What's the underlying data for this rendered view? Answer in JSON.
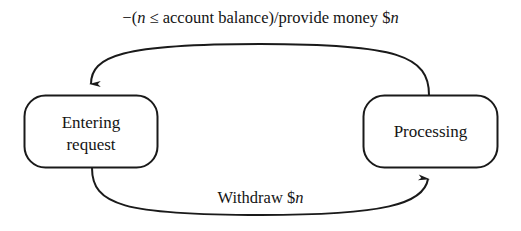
{
  "diagram": {
    "type": "state-transition-diagram",
    "background_color": "#ffffff",
    "stroke_color": "#1a1a1a",
    "states": [
      {
        "id": "entering-request",
        "label_line1": "Entering",
        "label_line2": "request",
        "shape": "rounded-rectangle"
      },
      {
        "id": "processing",
        "label_line1": "Processing",
        "label_line2": "",
        "shape": "rounded-rectangle"
      }
    ],
    "transitions": [
      {
        "id": "processing-to-entering-request",
        "from": "processing",
        "to": "entering-request",
        "direction": "right-to-left",
        "position": "top",
        "label_prefix": "−(",
        "label_var1": "n",
        "label_middle": " ≤ account balance)/provide money $",
        "label_var2": "n",
        "label_full": "−(n ≤ account balance)/provide money $n"
      },
      {
        "id": "entering-request-to-processing",
        "from": "entering-request",
        "to": "processing",
        "direction": "left-to-right",
        "position": "bottom",
        "label_prefix": "Withdraw $",
        "label_var1": "n",
        "label_middle": "",
        "label_var2": "",
        "label_full": "Withdraw $n"
      }
    ]
  }
}
